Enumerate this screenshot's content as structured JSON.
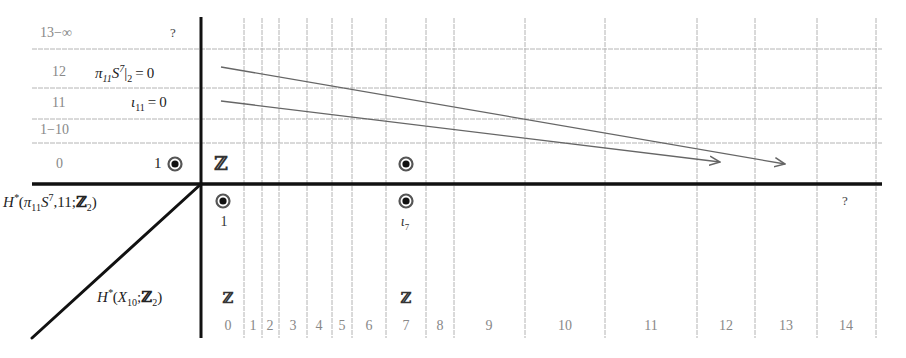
{
  "diagram": {
    "type": "spectral-sequence-chart",
    "row_labels": [
      {
        "text": "13−∞",
        "y": 34
      },
      {
        "text": "12",
        "y": 73
      },
      {
        "text": "11",
        "y": 104
      },
      {
        "text": "1−10",
        "y": 131
      },
      {
        "text": "0",
        "y": 165
      }
    ],
    "row_annotations": [
      {
        "text": "?",
        "y": 34
      },
      {
        "text": "π₁₁S⁷|₂ = 0",
        "y": 73
      },
      {
        "text": "ι₁₁ = 0",
        "y": 104
      },
      {
        "text": "1",
        "y": 165
      }
    ],
    "column_labels": [
      "0",
      "1",
      "2",
      "3",
      "4",
      "5",
      "6",
      "7",
      "8",
      "9",
      "10",
      "11",
      "12",
      "13",
      "14"
    ],
    "column_centers": [
      228,
      253,
      270,
      293,
      319,
      342,
      369,
      406,
      440,
      489,
      565,
      651,
      726,
      786,
      846
    ],
    "vertical_gridlines": [
      244,
      262,
      279,
      307,
      332,
      352,
      386,
      426,
      454,
      525,
      605,
      697,
      755,
      817,
      876
    ],
    "horizontal_gridlines": [
      49,
      88,
      119,
      143
    ],
    "axes": {
      "vertical_x": 201,
      "horizontal_y": 184,
      "top": 17,
      "bottom": 338,
      "right": 882,
      "diagonal_end": [
        32,
        338
      ]
    },
    "left_labels": {
      "top_row": "H*(π₁₁S⁷,11;ℤ₂)",
      "bottom_row": "H*(X₁₀;ℤ₂)"
    },
    "top_row_entries": [
      {
        "col": 0,
        "glyph": "ℤ",
        "kind": "group"
      },
      {
        "col": 7,
        "glyph": "dot",
        "kind": "generator"
      }
    ],
    "fiber_row_entries": [
      {
        "col": 0,
        "glyph": "dot",
        "label": "1"
      },
      {
        "col": 7,
        "glyph": "dot",
        "label": "ι₇"
      }
    ],
    "fiber_question_mark": {
      "text": "?",
      "col": 14
    },
    "base_row_entries": [
      {
        "col": 0,
        "text": "ℤ"
      },
      {
        "col": 7,
        "text": "ℤ"
      }
    ],
    "differentials": [
      {
        "from": [
          221,
          67
        ],
        "to": [
          785,
          164
        ],
        "source_row": "12",
        "target_col": 13
      },
      {
        "from": [
          221,
          101
        ],
        "to": [
          720,
          162
        ],
        "source_row": "11",
        "target_col": 12
      }
    ],
    "colors": {
      "axis": "#111111",
      "grid": "#b4b4b4",
      "arrow": "#666666",
      "row_label": "#888888",
      "dot_outer": "#555555",
      "dot_inner": "#111111"
    }
  }
}
